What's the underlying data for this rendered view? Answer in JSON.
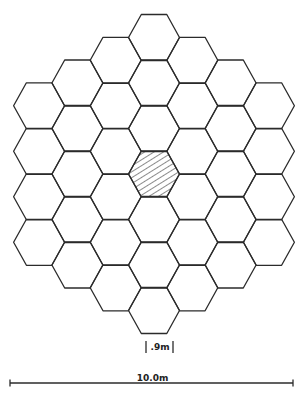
{
  "diagram": {
    "grid": {
      "layout": "flat-top hexagon of hexagons",
      "ring_radius": 3,
      "cell_count": 37,
      "center_px": [
        154,
        174
      ],
      "col_step_px": 38.3,
      "row_step_px": 45.5,
      "hex_half_width_px": 25.5,
      "hex_half_height_px": 23,
      "stroke_color": "#2b2b2b",
      "highlighted_cell": {
        "q": 0,
        "r": 0,
        "pattern": "diagonal-hatch"
      }
    },
    "cell_scale": {
      "label": ".9m",
      "x1": 146,
      "x2": 173,
      "y1": 341,
      "y2": 353
    },
    "overall_scale": {
      "label": "10.0m",
      "x1": 10,
      "x2": 293,
      "y": 383
    }
  }
}
